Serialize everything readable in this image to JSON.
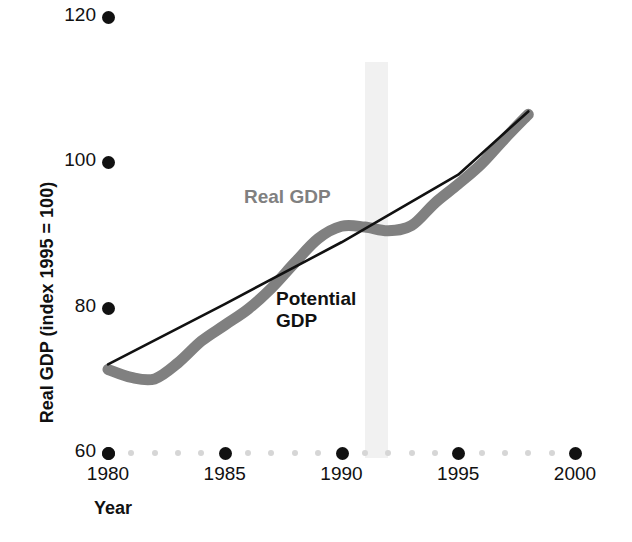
{
  "chart_data": {
    "type": "line",
    "title": "",
    "xlabel": "Year",
    "ylabel": "Real GDP (index 1995 = 100)",
    "xlim": [
      1980,
      2000
    ],
    "ylim": [
      60,
      120
    ],
    "grid": false,
    "legend_position": "inline-annotation",
    "xticks": [
      1980,
      1985,
      1990,
      1995,
      2000
    ],
    "xtick_labels": [
      "1980",
      "1985",
      "1990",
      "1995",
      "2000"
    ],
    "yticks": [
      60,
      80,
      100,
      120
    ],
    "ytick_labels": [
      "60",
      "80",
      "100",
      "120"
    ],
    "minor_xticks": [
      1981,
      1982,
      1983,
      1984,
      1986,
      1987,
      1988,
      1989,
      1991,
      1992,
      1993,
      1994,
      1996,
      1997,
      1998,
      1999
    ],
    "annotations": [
      {
        "text": "Real GDP",
        "series": "Real GDP",
        "color": "#808080"
      },
      {
        "text": "Potential\nGDP",
        "series": "Potential GDP",
        "color": "#111111"
      }
    ],
    "shaded_region": {
      "label": "recession",
      "x_start": 1991.0,
      "x_end": 1992.0,
      "color": "#f1f1f1"
    },
    "series": [
      {
        "name": "Real GDP",
        "color": "#808080",
        "style": "thick-line",
        "x": [
          1980,
          1981,
          1982,
          1983,
          1984,
          1985,
          1986,
          1987,
          1988,
          1989,
          1990,
          1991,
          1992,
          1993,
          1994,
          1995,
          1996,
          1997,
          1998
        ],
        "values": [
          71.5,
          70.4,
          70.2,
          72.4,
          75.4,
          77.6,
          79.8,
          82.7,
          86.2,
          89.5,
          91.2,
          91.1,
          90.6,
          91.3,
          94.4,
          97.0,
          99.8,
          103.3,
          106.6
        ]
      },
      {
        "name": "Potential GDP",
        "color": "#111111",
        "style": "thin-line",
        "x": [
          1980,
          1985,
          1990,
          1995,
          1998
        ],
        "values": [
          72.2,
          80.5,
          89.0,
          98.3,
          107.0
        ]
      }
    ]
  },
  "axes": {
    "y_title": "Real GDP (index 1995 = 100)",
    "x_title": "Year"
  },
  "labels": {
    "real_gdp": "Real GDP",
    "potential_gdp": "Potential\nGDP"
  },
  "colors": {
    "real_gdp": "#808080",
    "potential_gdp": "#111111",
    "recession_band": "#f1f1f1",
    "minor_tick": "#d6d6d6",
    "background": "#ffffff"
  }
}
